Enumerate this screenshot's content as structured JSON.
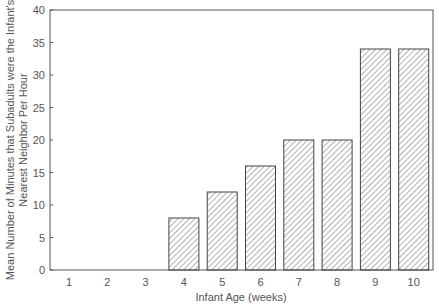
{
  "chart_data": {
    "type": "bar",
    "title": "",
    "xlabel": "Infant Age (weeks)",
    "ylabel_line1": "Mean Number of Minutes that Subadults were the Infant's",
    "ylabel_line2": "Nearest Neighbor Per Hour",
    "ylabel": "Mean Number of Minutes that Subadults were the Infant's Nearest Neighbor Per Hour",
    "categories": [
      "1",
      "2",
      "3",
      "4",
      "5",
      "6",
      "7",
      "8",
      "9",
      "10"
    ],
    "values": [
      0,
      0,
      0,
      8,
      12,
      16,
      20,
      20,
      34,
      34
    ],
    "ylim": [
      0,
      40
    ],
    "yticks": [
      0,
      5,
      10,
      15,
      20,
      25,
      30,
      35,
      40
    ],
    "grid": false,
    "legend": null,
    "bar_fill": "diagonal hatch",
    "colors": {
      "axis": "#555555",
      "bar_edge": "#444444",
      "hatch": "#666666",
      "background": "#ffffff"
    }
  }
}
